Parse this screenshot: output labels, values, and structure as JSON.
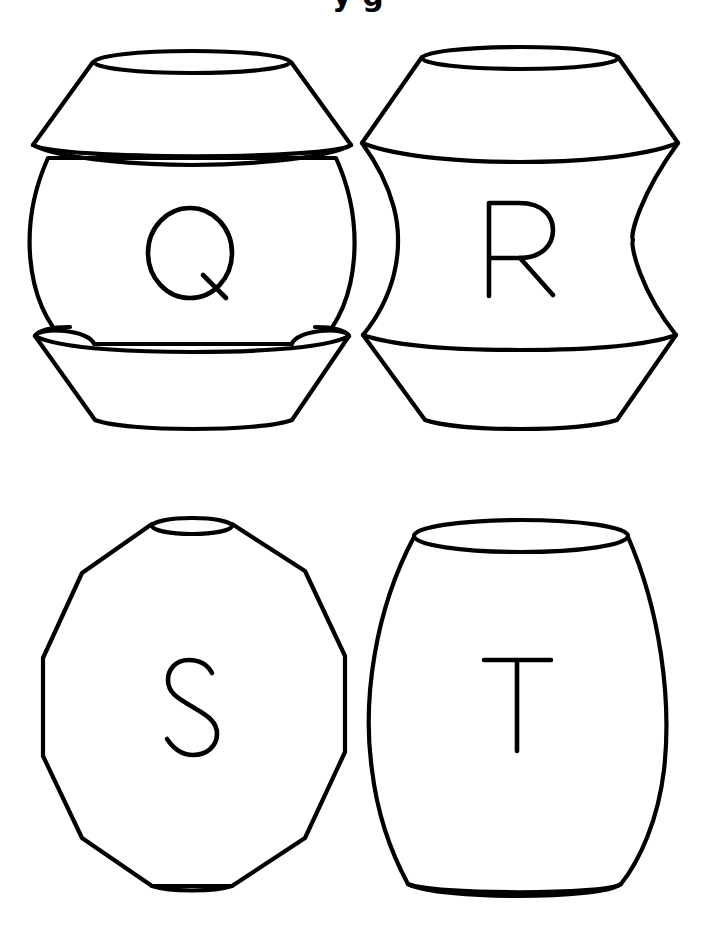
{
  "page": {
    "title_fragment": "y g",
    "background": "#ffffff",
    "stroke_color": "#000000"
  },
  "beads": [
    {
      "letter": "Q",
      "shape": "bowl-capped sphere",
      "position": "top-left"
    },
    {
      "letter": "R",
      "shape": "concave-waisted bead",
      "position": "top-right"
    },
    {
      "letter": "S",
      "shape": "faceted polygon bead",
      "position": "bottom-left"
    },
    {
      "letter": "T",
      "shape": "barrel bead",
      "position": "bottom-right"
    }
  ]
}
